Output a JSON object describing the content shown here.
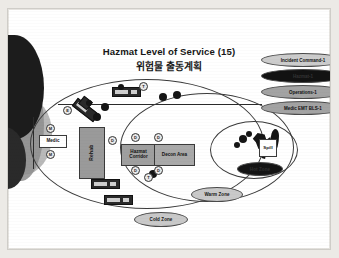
{
  "title": {
    "english": "Hazmat Level of Service (15)",
    "korean": "위험물 출동계획"
  },
  "zones": [
    {
      "name": "Cold Zone",
      "label": "Cold Zone"
    },
    {
      "name": "Warm Zone",
      "label": "Warm Zone"
    },
    {
      "name": "Hot Zone",
      "label": "Hot Zone"
    }
  ],
  "areas": {
    "rehab": "Rehab",
    "hazmat_corridor": "Hazmat Corridor",
    "decon_area": "Decon Area",
    "medic": "Medic",
    "spill": "Spill"
  },
  "legend": [
    {
      "label": "Incident Command-1",
      "style": "light"
    },
    {
      "label": "Hazmat-1",
      "style": "dark"
    },
    {
      "label": "Operations-1",
      "style": "mid"
    },
    {
      "label": "Medic EMT BLS-1",
      "style": "mid"
    }
  ],
  "markers": [
    {
      "label": "E",
      "x": 55,
      "y": 97
    },
    {
      "label": "T",
      "x": 131,
      "y": 73
    },
    {
      "label": "M",
      "x": 38,
      "y": 115
    },
    {
      "label": "M",
      "x": 38,
      "y": 141
    },
    {
      "label": "D",
      "x": 100,
      "y": 127
    },
    {
      "label": "D",
      "x": 123,
      "y": 124
    },
    {
      "label": "D",
      "x": 146,
      "y": 124
    },
    {
      "label": "D",
      "x": 123,
      "y": 157
    },
    {
      "label": "D",
      "x": 146,
      "y": 157
    },
    {
      "label": "T",
      "x": 136,
      "y": 164
    }
  ],
  "personnel_dots": [
    {
      "x": 93,
      "y": 94,
      "r": 4
    },
    {
      "x": 85,
      "y": 104,
      "r": 4
    },
    {
      "x": 78,
      "y": 91,
      "r": 3
    },
    {
      "x": 151,
      "y": 84,
      "r": 4
    },
    {
      "x": 165,
      "y": 82,
      "r": 4
    },
    {
      "x": 110,
      "y": 75,
      "r": 3
    },
    {
      "x": 141,
      "y": 161,
      "r": 4
    },
    {
      "x": 231,
      "y": 126,
      "r": 4
    },
    {
      "x": 238,
      "y": 122,
      "r": 3
    },
    {
      "x": 226,
      "y": 133,
      "r": 3
    }
  ],
  "colors": {
    "ink": "#161616",
    "zone_line": "#3b3b3b",
    "building_dark": "#1c1c1c",
    "box_grey": "#9f9f9f",
    "pill_light": "#c9c9c9",
    "pill_dark": "#141414",
    "page": "#ffffff"
  }
}
